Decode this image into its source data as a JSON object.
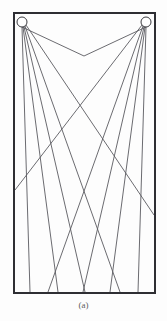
{
  "figure": {
    "caption": "(a)",
    "header_fragment": "",
    "colors": {
      "ink": "#3b3b40",
      "border": "#2e2e33",
      "ray": "#5a5a60",
      "node_fill": "#ffffff",
      "paper": "#fdfdfd",
      "caption_text": "#5d5d61"
    },
    "frame": {
      "x": 14,
      "y": 13,
      "width": 141,
      "height": 280,
      "stroke_width": 2
    },
    "nodes": [
      {
        "id": "source-left",
        "cx": 22,
        "cy": 22,
        "r": 5
      },
      {
        "id": "source-right",
        "cx": 146,
        "cy": 22,
        "r": 5
      }
    ],
    "rays": [
      {
        "from": "source-left",
        "x1": 22,
        "y1": 27,
        "x2": 84,
        "y2": 56
      },
      {
        "from": "source-left",
        "x1": 25,
        "y1": 26,
        "x2": 120,
        "y2": 292
      },
      {
        "from": "source-left",
        "x1": 24,
        "y1": 27,
        "x2": 85,
        "y2": 292
      },
      {
        "from": "source-left",
        "x1": 23,
        "y1": 27,
        "x2": 58,
        "y2": 292
      },
      {
        "from": "source-left",
        "x1": 22,
        "y1": 27,
        "x2": 30,
        "y2": 292
      },
      {
        "from": "source-left",
        "x1": 26,
        "y1": 25,
        "x2": 154,
        "y2": 215
      },
      {
        "from": "source-right",
        "x1": 146,
        "y1": 27,
        "x2": 84,
        "y2": 56
      },
      {
        "from": "source-right",
        "x1": 143,
        "y1": 26,
        "x2": 48,
        "y2": 292
      },
      {
        "from": "source-right",
        "x1": 144,
        "y1": 27,
        "x2": 83,
        "y2": 292
      },
      {
        "from": "source-right",
        "x1": 145,
        "y1": 27,
        "x2": 110,
        "y2": 292
      },
      {
        "from": "source-right",
        "x1": 146,
        "y1": 27,
        "x2": 138,
        "y2": 292
      },
      {
        "from": "source-right",
        "x1": 142,
        "y1": 25,
        "x2": 15,
        "y2": 190
      }
    ]
  }
}
